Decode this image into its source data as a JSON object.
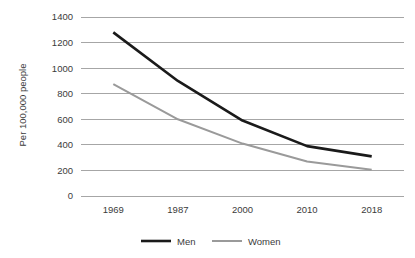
{
  "chart_data": {
    "type": "line",
    "title": "",
    "xlabel": "",
    "ylabel": "Per 100,000 people",
    "categories": [
      "1969",
      "1987",
      "2000",
      "2010",
      "2018"
    ],
    "ylim": [
      0,
      1400
    ],
    "yticks": [
      "0",
      "200",
      "400",
      "600",
      "800",
      "1000",
      "1200",
      "1400"
    ],
    "grid": true,
    "legend_position": "bottom",
    "series": [
      {
        "name": "Men",
        "color": "#1a1a1a",
        "width": 2.6,
        "values": [
          1280,
          900,
          590,
          390,
          310
        ]
      },
      {
        "name": "Women",
        "color": "#9a9a9a",
        "width": 2.0,
        "values": [
          875,
          600,
          410,
          270,
          205
        ]
      }
    ]
  },
  "legend": {
    "items": [
      {
        "label": "Men",
        "color": "#1a1a1a"
      },
      {
        "label": "Women",
        "color": "#9a9a9a"
      }
    ]
  },
  "colors": {
    "gridline": "#a6a6a6",
    "text": "#3b3b3b",
    "background": "#ffffff"
  }
}
